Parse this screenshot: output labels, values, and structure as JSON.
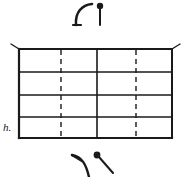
{
  "figure": {
    "background_color": "#ffffff",
    "ink_color": "#1a1a1a",
    "width": 185,
    "height": 177
  },
  "labels": {
    "left_label": "h."
  },
  "grid": {
    "left": 19,
    "right": 172,
    "top": 49,
    "bottom": 138,
    "row_count": 4,
    "horizontal_lines_y": [
      49,
      72,
      95,
      117,
      138
    ],
    "solid_vertical_lines_x": [
      19,
      97,
      172
    ],
    "dashed_vertical_lines_x": [
      61,
      136
    ],
    "dash_pattern": "5 4",
    "border_stroke_width": 2.0,
    "inner_stroke_width": 1.3,
    "dashed_stroke_width": 1.4
  },
  "corner_ticks": [
    {
      "name": "top-left-tick",
      "x1": 19,
      "y1": 49,
      "x2": 11,
      "y2": 44
    },
    {
      "name": "top-right-tick",
      "x1": 172,
      "y1": 49,
      "x2": 180,
      "y2": 44
    }
  ],
  "annotations": {
    "top": [
      {
        "name": "hook-curve-mark",
        "type": "curve",
        "path": "M 76 25 C 75 12 82 5 92 4",
        "stroke_width": 2.6,
        "foot": {
          "x1": 73,
          "y1": 25,
          "x2": 81,
          "y2": 25
        }
      },
      {
        "name": "pin-mark-vertical",
        "type": "pin",
        "stem": {
          "x1": 100,
          "y1": 8,
          "x2": 100,
          "y2": 25
        },
        "head": {
          "cx": 100,
          "cy": 6,
          "r": 3.2
        },
        "stroke_width": 2.0
      }
    ],
    "bottom": [
      {
        "name": "arrow-curve-mark",
        "type": "curve",
        "path": "M 89 175 C 86 163 82 157 72 155",
        "stroke_width": 2.4,
        "barb": {
          "x1": 72,
          "y1": 155,
          "x2": 81,
          "y2": 160
        }
      },
      {
        "name": "pin-mark-diagonal",
        "type": "pin",
        "stem": {
          "x1": 99,
          "y1": 157,
          "x2": 113,
          "y2": 172
        },
        "head": {
          "cx": 97,
          "cy": 155,
          "r": 3.4
        },
        "stroke_width": 2.0
      }
    ]
  }
}
